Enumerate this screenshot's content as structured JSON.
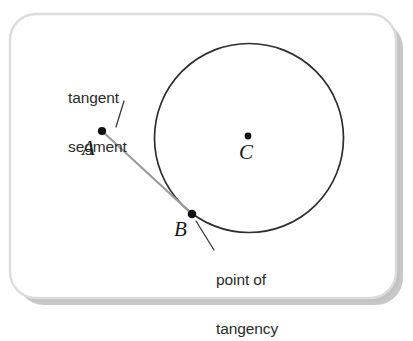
{
  "figure": {
    "background_color": "#ffffff",
    "card": {
      "fill": "#ffffff",
      "border_color": "#d8d8d8",
      "shadow_color": "#9a9a9a",
      "corner_radius": 26
    },
    "callouts": [
      {
        "id": "tangent-segment",
        "line1": "tangent",
        "line2": "segment"
      },
      {
        "id": "point-of-tangency",
        "line1": "point of",
        "line2": "tangency"
      }
    ],
    "points": [
      {
        "id": "A",
        "label": "A",
        "x": 102,
        "y": 131,
        "role": "external-point"
      },
      {
        "id": "B",
        "label": "B",
        "x": 192,
        "y": 214,
        "role": "point-of-tangency"
      },
      {
        "id": "C",
        "label": "C",
        "x": 249,
        "y": 137,
        "role": "circle-center"
      }
    ],
    "circle": {
      "center_x": 249,
      "center_y": 138,
      "radius": 94.5,
      "stroke": "#2e2e2e",
      "stroke_width": 1.6,
      "fill": "none"
    },
    "tangent_segment": {
      "from": "A",
      "to": "B",
      "x1": 102,
      "y1": 131,
      "x2": 192,
      "y2": 214,
      "stroke": "#9b9b9b",
      "stroke_width": 2.1
    },
    "leader_lines": [
      {
        "id": "leader-tangent-segment",
        "x1": 124,
        "y1": 101,
        "x2": 116,
        "y2": 127,
        "stroke": "#3a3a3a"
      },
      {
        "id": "leader-point-of-tangency",
        "x1": 214,
        "y1": 250,
        "x2": 196,
        "y2": 222,
        "stroke": "#3a3a3a"
      }
    ],
    "dot_color": "#111111",
    "dot_radius": 4
  }
}
